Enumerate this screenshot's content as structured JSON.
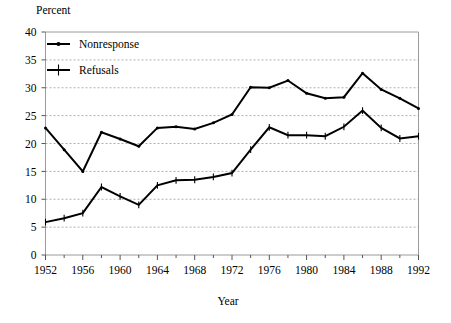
{
  "chart_data": {
    "type": "line",
    "title": "",
    "xlabel": "Year",
    "ylabel": "Percent",
    "xlim": [
      1952,
      1992
    ],
    "ylim": [
      0,
      40
    ],
    "ytick_step": 5,
    "xtick_step": 4,
    "xminor_step": 2,
    "grid": "horizontal-dashed",
    "legend_position": "top-left-inside",
    "yticks": [
      "0",
      "5",
      "10",
      "15",
      "20",
      "25",
      "30",
      "35",
      "40"
    ],
    "xticks": [
      "1952",
      "1956",
      "1960",
      "1964",
      "1968",
      "1972",
      "1976",
      "1980",
      "1984",
      "1988",
      "1992"
    ],
    "x": [
      1952,
      1954,
      1956,
      1958,
      1960,
      1962,
      1964,
      1966,
      1968,
      1970,
      1972,
      1974,
      1976,
      1978,
      1980,
      1982,
      1984,
      1986,
      1988,
      1990,
      1992
    ],
    "series": [
      {
        "name": "Nonresponse",
        "marker": "dot",
        "values": [
          22.8,
          18.9,
          15.0,
          22.0,
          20.8,
          19.5,
          22.8,
          23.0,
          22.6,
          23.7,
          25.2,
          30.1,
          30.0,
          31.3,
          29.0,
          28.1,
          28.3,
          32.6,
          29.7,
          28.1,
          26.3
        ]
      },
      {
        "name": "Refusals",
        "marker": "plus",
        "values": [
          5.9,
          6.6,
          7.5,
          12.2,
          10.5,
          9.0,
          12.5,
          13.4,
          13.5,
          14.0,
          14.7,
          18.9,
          22.9,
          21.5,
          21.5,
          21.3,
          23.0,
          25.9,
          22.8,
          20.9,
          21.3
        ]
      }
    ],
    "colors": {
      "line": "#000000",
      "grid": "#b0b0b0",
      "frame": "#9a9a9a",
      "background": "#ffffff",
      "text": "#000000"
    }
  },
  "legend": {
    "items": [
      {
        "label": "Nonresponse"
      },
      {
        "label": "Refusals"
      }
    ]
  },
  "labels": {
    "y_axis_title": "Percent",
    "x_axis_title": "Year"
  }
}
